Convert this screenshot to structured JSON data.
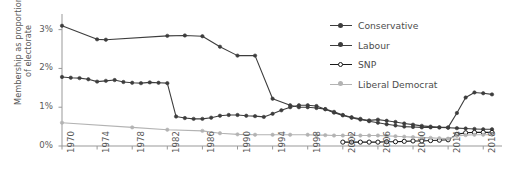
{
  "chart_data": {
    "type": "line",
    "title": "",
    "xlabel": "",
    "ylabel_line1": "Membership as proportion",
    "ylabel_line2": "of electorate",
    "grid": false,
    "legend_position": "top-right",
    "xlim": [
      1970,
      2019
    ],
    "ylim": [
      0,
      3.3
    ],
    "ytick_labels": [
      "0%",
      "1%",
      "2%",
      "3%"
    ],
    "ytick_values": [
      0,
      1,
      2,
      3
    ],
    "xtick_labels": [
      "1970",
      "1974",
      "1978",
      "1982",
      "1986",
      "1990",
      "1994",
      "1998",
      "2002",
      "2006",
      "2010",
      "2014",
      "2018"
    ],
    "xtick_values": [
      1970,
      1974,
      1978,
      1982,
      1986,
      1990,
      1994,
      1998,
      2002,
      2006,
      2010,
      2014,
      2018
    ],
    "colors": {
      "conservative": "#3d3d3d",
      "labour": "#3d3d3d",
      "snp": "#1a1a1a",
      "liberal_democrat": "#b3b3b3",
      "axis": "#999999",
      "text": "#595959"
    },
    "series": [
      {
        "name": "Conservative",
        "marker": "filled-circle",
        "color": "#3d3d3d",
        "x": [
          1970,
          1974,
          1975,
          1982,
          1984,
          1986,
          1988,
          1990,
          1992,
          1994,
          1996,
          1997,
          1998,
          1999,
          2000,
          2001,
          2002,
          2003,
          2004,
          2005,
          2006,
          2007,
          2008,
          2009,
          2010,
          2011,
          2012,
          2013,
          2014,
          2015,
          2016,
          2017,
          2018,
          2019
        ],
        "y": [
          3.1,
          2.75,
          2.74,
          2.84,
          2.85,
          2.83,
          2.56,
          2.33,
          2.33,
          1.22,
          1.05,
          1.0,
          1.0,
          0.98,
          0.95,
          0.86,
          0.79,
          0.73,
          0.68,
          0.66,
          0.68,
          0.65,
          0.62,
          0.58,
          0.55,
          0.52,
          0.5,
          0.48,
          0.47,
          0.46,
          0.45,
          0.44,
          0.43,
          0.43
        ]
      },
      {
        "name": "Labour",
        "marker": "filled-circle",
        "color": "#3d3d3d",
        "x": [
          1970,
          1971,
          1972,
          1973,
          1974,
          1975,
          1976,
          1977,
          1978,
          1979,
          1980,
          1981,
          1982,
          1983,
          1984,
          1985,
          1986,
          1987,
          1988,
          1989,
          1990,
          1991,
          1992,
          1993,
          1994,
          1995,
          1996,
          1997,
          1998,
          1999,
          2000,
          2001,
          2002,
          2003,
          2004,
          2005,
          2006,
          2007,
          2008,
          2009,
          2010,
          2011,
          2012,
          2013,
          2014,
          2015,
          2016,
          2017,
          2018,
          2019
        ],
        "y": [
          1.78,
          1.76,
          1.75,
          1.72,
          1.66,
          1.68,
          1.7,
          1.65,
          1.63,
          1.62,
          1.64,
          1.63,
          1.62,
          0.76,
          0.72,
          0.7,
          0.7,
          0.73,
          0.78,
          0.8,
          0.8,
          0.78,
          0.77,
          0.75,
          0.83,
          0.92,
          1.0,
          1.05,
          1.05,
          1.03,
          0.95,
          0.88,
          0.8,
          0.74,
          0.7,
          0.64,
          0.6,
          0.56,
          0.53,
          0.5,
          0.49,
          0.48,
          0.48,
          0.48,
          0.48,
          0.85,
          1.25,
          1.38,
          1.36,
          1.33
        ]
      },
      {
        "name": "SNP",
        "marker": "hollow-circle",
        "color": "#1a1a1a",
        "x": [
          2002,
          2003,
          2004,
          2005,
          2006,
          2007,
          2008,
          2009,
          2010,
          2011,
          2012,
          2013,
          2014,
          2015,
          2016,
          2017,
          2018,
          2019
        ],
        "y": [
          0.1,
          0.1,
          0.1,
          0.1,
          0.1,
          0.11,
          0.11,
          0.12,
          0.13,
          0.13,
          0.14,
          0.15,
          0.16,
          0.3,
          0.34,
          0.35,
          0.35,
          0.35
        ]
      },
      {
        "name": "Liberal Democrat",
        "marker": "filled-circle",
        "color": "#b3b3b3",
        "x": [
          1970,
          1978,
          1982,
          1986,
          1988,
          1990,
          1992,
          1994,
          1996,
          1998,
          1999,
          2000,
          2001,
          2002,
          2003,
          2004,
          2005,
          2006,
          2007,
          2008,
          2009,
          2010,
          2011,
          2012,
          2013,
          2014,
          2015,
          2016,
          2017,
          2018,
          2019
        ],
        "y": [
          0.6,
          0.48,
          0.42,
          0.39,
          0.33,
          0.3,
          0.29,
          0.29,
          0.29,
          0.29,
          0.28,
          0.28,
          0.27,
          0.27,
          0.27,
          0.27,
          0.27,
          0.27,
          0.26,
          0.25,
          0.24,
          0.23,
          0.22,
          0.21,
          0.2,
          0.19,
          0.26,
          0.28,
          0.29,
          0.29,
          0.29
        ]
      }
    ]
  }
}
